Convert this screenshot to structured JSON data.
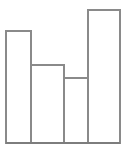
{
  "chart_data": {
    "type": "bar",
    "title": "",
    "subtitle": "",
    "xlabel": "",
    "ylabel": "",
    "categories": [
      "1",
      "2",
      "3",
      "4"
    ],
    "values": [
      112,
      78,
      65,
      133
    ],
    "ylim": [
      0,
      143
    ],
    "xlim": [
      0,
      126
    ],
    "grid": false,
    "legend": null,
    "legend_position": "none",
    "tick_labels_x": [],
    "tick_labels_y": [],
    "annotations": [],
    "bars": [
      {
        "name": "bar-1",
        "x_left": 6,
        "x_right": 31,
        "top_y": 31,
        "base_y": 143,
        "width": 25,
        "height": 112
      },
      {
        "name": "bar-2",
        "x_left": 31,
        "x_right": 64,
        "top_y": 65,
        "base_y": 143,
        "width": 33,
        "height": 78
      },
      {
        "name": "bar-3",
        "x_left": 64,
        "x_right": 88,
        "top_y": 78,
        "base_y": 143,
        "width": 24,
        "height": 65
      },
      {
        "name": "bar-4",
        "x_left": 88,
        "x_right": 120,
        "top_y": 10,
        "base_y": 143,
        "width": 32,
        "height": 133
      }
    ],
    "baseline": {
      "y": 143,
      "x_start": 6,
      "x_end": 120
    }
  },
  "style": {
    "background_color": "#ffffff",
    "bar_stroke_color": "#8a8a8a",
    "bar_fill_color": "none",
    "axis_color": "#7d7d7d",
    "stroke_width": 1.6
  }
}
